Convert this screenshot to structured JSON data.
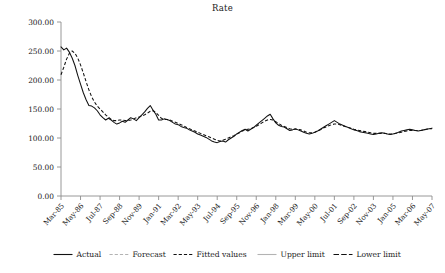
{
  "chart": {
    "title": "Rate",
    "type": "line"
  },
  "yaxis": {
    "labels": [
      "300.00",
      "250.00",
      "200.00",
      "150.00",
      "100.00",
      "50.00",
      "0.00"
    ]
  },
  "legend": {
    "items": [
      {
        "label": "Actual",
        "style": "solid-black"
      },
      {
        "label": "Forecast",
        "style": "dash-gray"
      },
      {
        "label": "Fitted values",
        "style": "dash-black"
      },
      {
        "label": "Upper limit",
        "style": "solid-gray"
      },
      {
        "label": "Lower limit",
        "style": "dash-long-black"
      }
    ]
  },
  "chart_data": {
    "type": "line",
    "title": "Rate",
    "xlabel": "",
    "ylabel": "",
    "ylim": [
      0,
      300
    ],
    "ytick_values": [
      0,
      50,
      100,
      150,
      200,
      250,
      300
    ],
    "ytick_labels": [
      "0.00",
      "50.00",
      "100.00",
      "150.00",
      "200.00",
      "250.00",
      "300.00"
    ],
    "grid": false,
    "legend_position": "bottom",
    "xtick_labels": [
      "Mar-85",
      "May-86",
      "Jul-87",
      "Sep-88",
      "Nov-89",
      "Jan-91",
      "Mar-92",
      "May-93",
      "Jul-94",
      "Sep-95",
      "Nov-96",
      "Jan-98",
      "Mar-99",
      "May-00",
      "Jul-01",
      "Sep-02",
      "Nov-03",
      "Jan-05",
      "Mar-06",
      "May-07"
    ],
    "xtick_interval_months": 14,
    "x_start": "Mar-85",
    "x_end": "May-07",
    "n_points": 134,
    "series": [
      {
        "name": "Actual",
        "style": "solid",
        "color": "#111111",
        "values": [
          257,
          252,
          255,
          248,
          238,
          225,
          208,
          193,
          178,
          166,
          156,
          155,
          152,
          147,
          140,
          135,
          131,
          134,
          131,
          127,
          124,
          126,
          129,
          127,
          131,
          135,
          133,
          130,
          135,
          140,
          145,
          151,
          156,
          148,
          141,
          131,
          131,
          133,
          132,
          130,
          127,
          124,
          123,
          120,
          118,
          117,
          114,
          112,
          110,
          107,
          105,
          103,
          101,
          98,
          95,
          93,
          92,
          94,
          95,
          93,
          97,
          100,
          103,
          107,
          110,
          113,
          115,
          112,
          115,
          118,
          122,
          126,
          130,
          134,
          138,
          141,
          133,
          126,
          122,
          120,
          119,
          116,
          113,
          114,
          116,
          114,
          112,
          110,
          108,
          107,
          108,
          110,
          112,
          115,
          118,
          121,
          124,
          127,
          130,
          127,
          124,
          122,
          120,
          118,
          116,
          114,
          113,
          111,
          110,
          109,
          108,
          107,
          106,
          107,
          108,
          109,
          108,
          107,
          106,
          107,
          108,
          110,
          112,
          113,
          114,
          115,
          114,
          113,
          112,
          113,
          114,
          115,
          116,
          117
        ]
      },
      {
        "name": "Fitted values",
        "style": "dashed",
        "color": "#111111",
        "values": [
          209,
          222,
          236,
          246,
          250,
          246,
          238,
          226,
          212,
          197,
          183,
          171,
          162,
          155,
          150,
          145,
          140,
          136,
          132,
          130,
          130,
          131,
          131,
          130,
          130,
          131,
          133,
          135,
          136,
          138,
          140,
          143,
          146,
          147,
          144,
          139,
          134,
          132,
          132,
          131,
          129,
          127,
          125,
          123,
          121,
          118,
          116,
          114,
          112,
          110,
          108,
          106,
          104,
          102,
          100,
          98,
          96,
          95,
          96,
          98,
          100,
          102,
          104,
          107,
          109,
          112,
          114,
          115,
          116,
          118,
          120,
          123,
          126,
          129,
          131,
          132,
          131,
          128,
          125,
          122,
          120,
          118,
          116,
          115,
          115,
          115,
          114,
          112,
          110,
          109,
          109,
          110,
          112,
          114,
          117,
          119,
          121,
          123,
          124,
          124,
          123,
          121,
          120,
          118,
          117,
          115,
          114,
          113,
          112,
          111,
          110,
          109,
          108,
          108,
          108,
          108,
          108,
          107,
          107,
          107,
          108,
          109,
          110,
          111,
          112,
          113,
          113,
          113,
          113,
          113,
          114,
          115,
          116,
          116
        ]
      }
    ]
  }
}
